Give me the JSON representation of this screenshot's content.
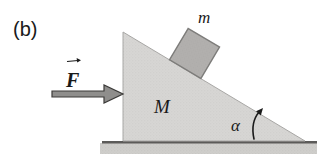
{
  "figure": {
    "panel_label": "(b)"
  },
  "labels": {
    "force": "F",
    "wedge_mass": "M",
    "block_mass": "m",
    "incline_angle": "α"
  },
  "colors": {
    "background": "#ffffff",
    "wedge_fill": "#d7d6d4",
    "wedge_edge": "#a9a8a6",
    "block_fill": "#b2b0ae",
    "block_edge": "#7e7d7b",
    "force_arrow_fill": "#8f8e8c",
    "force_arrow_outline": "#3c3b39",
    "ground_fill": "#cfcecb",
    "ground_line": "#5c5b59",
    "angle_arrow": "#1a1a1a",
    "text": "#1a1a1a"
  }
}
